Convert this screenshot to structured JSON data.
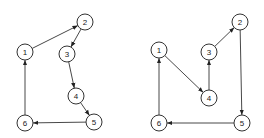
{
  "graphs": [
    {
      "name": "left-graph",
      "nodes": [
        {
          "id": "1",
          "label": "1"
        },
        {
          "id": "2",
          "label": "2"
        },
        {
          "id": "3",
          "label": "3"
        },
        {
          "id": "4",
          "label": "4"
        },
        {
          "id": "5",
          "label": "5"
        },
        {
          "id": "6",
          "label": "6"
        }
      ],
      "edges": [
        [
          "1",
          "2"
        ],
        [
          "2",
          "3"
        ],
        [
          "3",
          "4"
        ],
        [
          "4",
          "5"
        ],
        [
          "5",
          "6"
        ],
        [
          "6",
          "1"
        ]
      ]
    },
    {
      "name": "right-graph",
      "nodes": [
        {
          "id": "1",
          "label": "1"
        },
        {
          "id": "2",
          "label": "2"
        },
        {
          "id": "3",
          "label": "3"
        },
        {
          "id": "4",
          "label": "4"
        },
        {
          "id": "5",
          "label": "5"
        },
        {
          "id": "6",
          "label": "6"
        }
      ],
      "edges": [
        [
          "1",
          "4"
        ],
        [
          "4",
          "3"
        ],
        [
          "3",
          "2"
        ],
        [
          "2",
          "5"
        ],
        [
          "5",
          "6"
        ],
        [
          "6",
          "1"
        ]
      ]
    }
  ]
}
